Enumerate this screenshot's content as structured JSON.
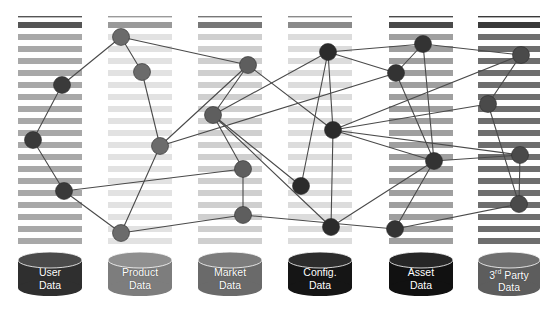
{
  "diagram": {
    "type": "network-over-striped-columns",
    "background": "#ffffff",
    "edge_color": "#4a4a4a",
    "edge_width": 1.1,
    "node_radius": 8.5,
    "canvas": {
      "width": 552,
      "height": 315
    }
  },
  "columns": [
    {
      "id": "user-data",
      "label_line1": "User",
      "label_line2": "Data",
      "label_sup": "",
      "x": 18,
      "width": 64,
      "stripe_color": "#a8a8a8",
      "top_rule_color": "#555555",
      "cylinder_color": "#2f2f2f",
      "cylinder_top_color": "#4a4a4a",
      "cylinder_x": 18,
      "cylinder_y": 252,
      "cylinder_w": 64,
      "cylinder_h": 44,
      "nodes": [
        {
          "id": "u1",
          "x": 62,
          "y": 85,
          "color": "#3a3a3a"
        },
        {
          "id": "u2",
          "x": 33,
          "y": 140,
          "color": "#3a3a3a"
        },
        {
          "id": "u3",
          "x": 64,
          "y": 191,
          "color": "#3a3a3a"
        }
      ]
    },
    {
      "id": "product-data",
      "label_line1": "Product",
      "label_line2": "Data",
      "label_sup": "",
      "x": 108,
      "width": 64,
      "stripe_color": "#e2e2e2",
      "top_rule_color": "#9a9a9a",
      "cylinder_color": "#7d7d7d",
      "cylinder_top_color": "#8f8f8f",
      "cylinder_x": 108,
      "cylinder_y": 252,
      "cylinder_w": 64,
      "cylinder_h": 44,
      "nodes": [
        {
          "id": "p1",
          "x": 121,
          "y": 37,
          "color": "#6b6b6b"
        },
        {
          "id": "p2",
          "x": 142,
          "y": 72,
          "color": "#6b6b6b"
        },
        {
          "id": "p3",
          "x": 160,
          "y": 146,
          "color": "#6b6b6b"
        },
        {
          "id": "p4",
          "x": 121,
          "y": 233,
          "color": "#6b6b6b"
        }
      ]
    },
    {
      "id": "market-data",
      "label_line1": "Market",
      "label_line2": "Data",
      "label_sup": "",
      "x": 198,
      "width": 64,
      "stripe_color": "#cfcfcf",
      "top_rule_color": "#777777",
      "cylinder_color": "#6a6a6a",
      "cylinder_top_color": "#7c7c7c",
      "cylinder_x": 198,
      "cylinder_y": 252,
      "cylinder_w": 64,
      "cylinder_h": 44,
      "nodes": [
        {
          "id": "m1",
          "x": 248,
          "y": 65,
          "color": "#5e5e5e"
        },
        {
          "id": "m2",
          "x": 213,
          "y": 115,
          "color": "#5e5e5e"
        },
        {
          "id": "m3",
          "x": 243,
          "y": 169,
          "color": "#5e5e5e"
        },
        {
          "id": "m4",
          "x": 243,
          "y": 215,
          "color": "#5e5e5e"
        }
      ]
    },
    {
      "id": "config-data",
      "label_line1": "Config.",
      "label_line2": "Data",
      "label_sup": "",
      "x": 288,
      "width": 64,
      "stripe_color": "#dcdcdc",
      "top_rule_color": "#8a8a8a",
      "cylinder_color": "#151515",
      "cylinder_top_color": "#2c2c2c",
      "cylinder_x": 288,
      "cylinder_y": 252,
      "cylinder_w": 64,
      "cylinder_h": 44,
      "nodes": [
        {
          "id": "c1",
          "x": 328,
          "y": 52,
          "color": "#2b2b2b"
        },
        {
          "id": "c2",
          "x": 333,
          "y": 130,
          "color": "#2b2b2b"
        },
        {
          "id": "c3",
          "x": 301,
          "y": 186,
          "color": "#2b2b2b"
        },
        {
          "id": "c4",
          "x": 331,
          "y": 227,
          "color": "#2b2b2b"
        }
      ]
    },
    {
      "id": "asset-data",
      "label_line1": "Asset",
      "label_line2": "Data",
      "label_sup": "",
      "x": 389,
      "width": 64,
      "stripe_color": "#9f9f9f",
      "top_rule_color": "#4a4a4a",
      "cylinder_color": "#111111",
      "cylinder_top_color": "#262626",
      "cylinder_x": 389,
      "cylinder_y": 252,
      "cylinder_w": 64,
      "cylinder_h": 44,
      "nodes": [
        {
          "id": "a1",
          "x": 423,
          "y": 44,
          "color": "#333333"
        },
        {
          "id": "a2",
          "x": 396,
          "y": 73,
          "color": "#333333"
        },
        {
          "id": "a3",
          "x": 434,
          "y": 161,
          "color": "#333333"
        },
        {
          "id": "a4",
          "x": 395,
          "y": 229,
          "color": "#333333"
        }
      ]
    },
    {
      "id": "third-party-data",
      "label_line1": "3 Party",
      "label_line2": "Data",
      "label_sup": "rd",
      "x": 478,
      "width": 62,
      "stripe_color": "#6e6e6e",
      "top_rule_color": "#3a3a3a",
      "cylinder_color": "#5d5d5d",
      "cylinder_top_color": "#6f6f6f",
      "cylinder_x": 478,
      "cylinder_y": 252,
      "cylinder_w": 62,
      "cylinder_h": 44,
      "nodes": [
        {
          "id": "t1",
          "x": 521,
          "y": 55,
          "color": "#4a4a4a"
        },
        {
          "id": "t2",
          "x": 488,
          "y": 104,
          "color": "#4a4a4a"
        },
        {
          "id": "t3",
          "x": 520,
          "y": 155,
          "color": "#4a4a4a"
        },
        {
          "id": "t4",
          "x": 519,
          "y": 204,
          "color": "#4a4a4a"
        }
      ]
    }
  ],
  "edges": [
    {
      "from": "u1",
      "to": "u2"
    },
    {
      "from": "u2",
      "to": "u3"
    },
    {
      "from": "u1",
      "to": "p1"
    },
    {
      "from": "u3",
      "to": "p4"
    },
    {
      "from": "u3",
      "to": "m3"
    },
    {
      "from": "p1",
      "to": "p2"
    },
    {
      "from": "p2",
      "to": "p3"
    },
    {
      "from": "p3",
      "to": "p4"
    },
    {
      "from": "p1",
      "to": "m1"
    },
    {
      "from": "p3",
      "to": "m1"
    },
    {
      "from": "p3",
      "to": "a2"
    },
    {
      "from": "p4",
      "to": "m4"
    },
    {
      "from": "m1",
      "to": "m2"
    },
    {
      "from": "m2",
      "to": "m3"
    },
    {
      "from": "m3",
      "to": "m4"
    },
    {
      "from": "m1",
      "to": "c2"
    },
    {
      "from": "m2",
      "to": "c1"
    },
    {
      "from": "m2",
      "to": "c3"
    },
    {
      "from": "m2",
      "to": "c4"
    },
    {
      "from": "m4",
      "to": "a4"
    },
    {
      "from": "c1",
      "to": "c2"
    },
    {
      "from": "c1",
      "to": "c3"
    },
    {
      "from": "c2",
      "to": "c4"
    },
    {
      "from": "c1",
      "to": "a1"
    },
    {
      "from": "c1",
      "to": "a2"
    },
    {
      "from": "c2",
      "to": "a3"
    },
    {
      "from": "c2",
      "to": "t1"
    },
    {
      "from": "c2",
      "to": "t2"
    },
    {
      "from": "c2",
      "to": "t3"
    },
    {
      "from": "c4",
      "to": "a3"
    },
    {
      "from": "a1",
      "to": "a2"
    },
    {
      "from": "a1",
      "to": "a3"
    },
    {
      "from": "a2",
      "to": "a3"
    },
    {
      "from": "a3",
      "to": "a4"
    },
    {
      "from": "a1",
      "to": "t1"
    },
    {
      "from": "a3",
      "to": "t3"
    },
    {
      "from": "a4",
      "to": "t4"
    },
    {
      "from": "t1",
      "to": "t2"
    },
    {
      "from": "t2",
      "to": "t4"
    },
    {
      "from": "t3",
      "to": "t4"
    }
  ],
  "stripe_layout": {
    "top": 22,
    "count": 19,
    "pitch": 12,
    "height": 6
  }
}
